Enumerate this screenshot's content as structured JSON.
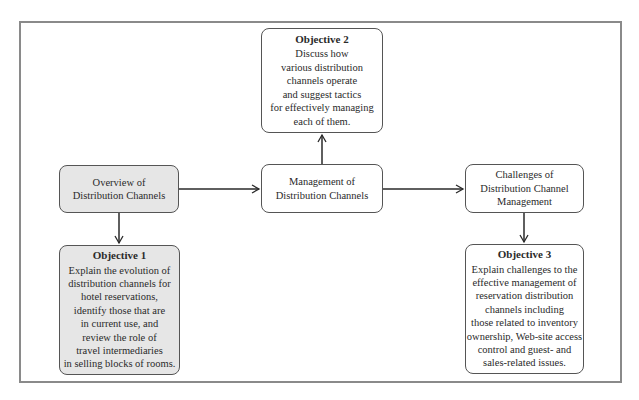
{
  "diagram": {
    "nodes": {
      "overview": {
        "label": "Overview of\nDistribution Channels",
        "fill": "#e6e6e6"
      },
      "management": {
        "label": "Management of\nDistribution Channels",
        "fill": "#ffffff"
      },
      "challenges": {
        "label": "Challenges of\nDistribution Channel\nManagement",
        "fill": "#ffffff"
      },
      "objective1": {
        "title": "Objective 1",
        "body": "Explain the evolution of\ndistribution channels for\nhotel reservations,\nidentify those that are\nin current use, and\nreview the role of\ntravel intermediaries\nin selling blocks of rooms.",
        "fill": "#e6e6e6"
      },
      "objective2": {
        "title": "Objective 2",
        "body": "Discuss how\nvarious distribution\nchannels operate\nand suggest tactics\nfor effectively managing\neach of them.",
        "fill": "#ffffff"
      },
      "objective3": {
        "title": "Objective 3",
        "body": "Explain challenges to the\neffective management of\nreservation distribution\nchannels including\nthose related to inventory\nownership, Web-site access\ncontrol and guest- and\nsales-related issues.",
        "fill": "#ffffff"
      }
    },
    "edges": [
      {
        "from": "overview",
        "to": "management"
      },
      {
        "from": "management",
        "to": "challenges"
      },
      {
        "from": "management",
        "to": "objective2"
      },
      {
        "from": "overview",
        "to": "objective1"
      },
      {
        "from": "challenges",
        "to": "objective3"
      }
    ]
  }
}
